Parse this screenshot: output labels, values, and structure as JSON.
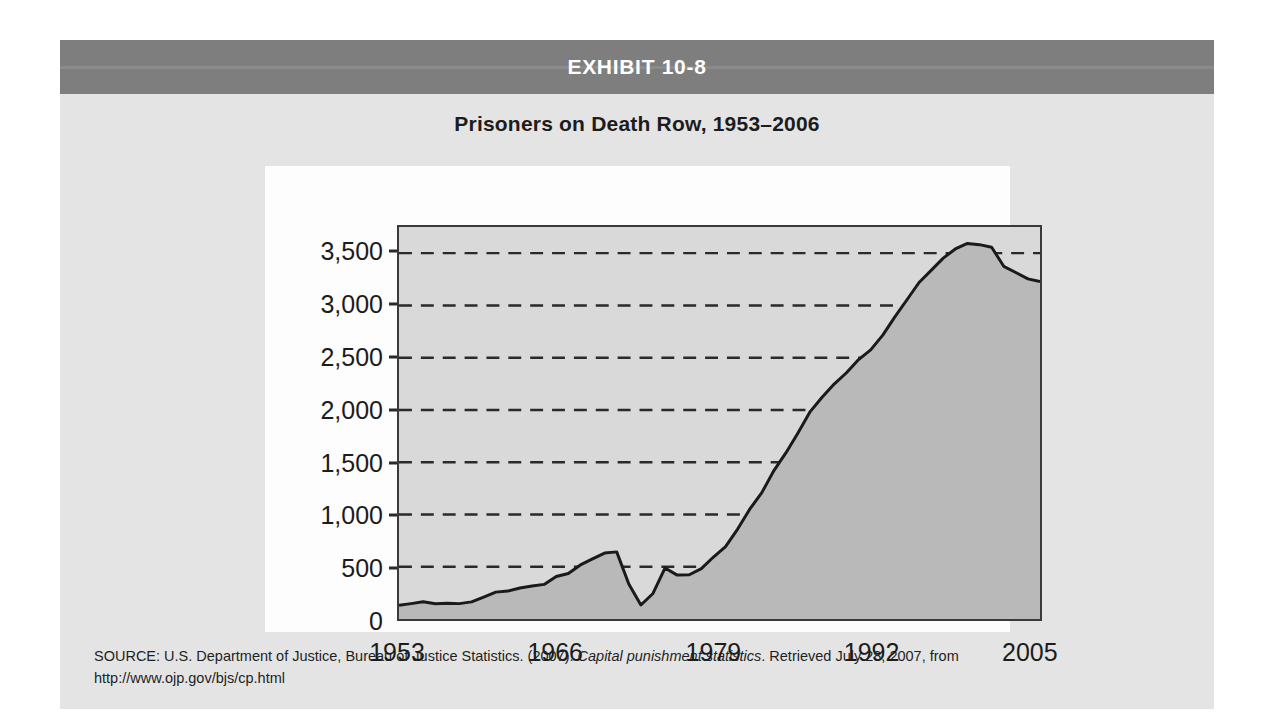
{
  "exhibit": {
    "header_label": "EXHIBIT 10-8",
    "header_bg": "#7e7e7e",
    "panel_bg": "#e4e4e4"
  },
  "source": {
    "prefix": "SOURCE: U.S. Department of Justice, Bureau of Justice Statistics. (2007). ",
    "italic_title": "Capital punishment statistics",
    "suffix": ". Retrieved July 28, 2007, from",
    "url": "http://www.ojp.gov/bjs/cp.html"
  },
  "chart_data": {
    "type": "area",
    "title": "Prisoners on Death Row, 1953–2006",
    "xlabel": "",
    "ylabel": "",
    "xlim": [
      1953,
      2006
    ],
    "ylim": [
      0,
      3750
    ],
    "grid": true,
    "legend": "none",
    "line_color": "#1a1a1a",
    "fill_color": "#b9b9b9",
    "plot_bg": "#d9d9d9",
    "gridline_color": "#2a2a2a",
    "y_ticks": [
      0,
      500,
      1000,
      1500,
      2000,
      2500,
      3000,
      3500
    ],
    "y_tick_labels": [
      "0",
      "500",
      "1,000",
      "1,500",
      "2,000",
      "2,500",
      "3,000",
      "3,500"
    ],
    "x_ticks": [
      1953,
      1966,
      1979,
      1992,
      2005
    ],
    "x_tick_labels": [
      "1953",
      "1966",
      "1979",
      "1992",
      "2005"
    ],
    "x": [
      1953,
      1954,
      1955,
      1956,
      1957,
      1958,
      1959,
      1960,
      1961,
      1962,
      1963,
      1964,
      1965,
      1966,
      1967,
      1968,
      1969,
      1970,
      1971,
      1972,
      1973,
      1974,
      1975,
      1976,
      1977,
      1978,
      1979,
      1980,
      1981,
      1982,
      1983,
      1984,
      1985,
      1986,
      1987,
      1988,
      1989,
      1990,
      1991,
      1992,
      1993,
      1994,
      1995,
      1996,
      1997,
      1998,
      1999,
      2000,
      2001,
      2002,
      2003,
      2004,
      2005,
      2006
    ],
    "values": [
      131,
      147,
      165,
      146,
      151,
      147,
      164,
      210,
      257,
      267,
      297,
      315,
      331,
      406,
      435,
      517,
      575,
      631,
      642,
      334,
      134,
      244,
      488,
      420,
      423,
      482,
      593,
      692,
      860,
      1050,
      1209,
      1420,
      1591,
      1781,
      1984,
      2124,
      2250,
      2356,
      2482,
      2575,
      2716,
      2890,
      3054,
      3219,
      3335,
      3452,
      3540,
      3593,
      3581,
      3557,
      3374,
      3315,
      3254,
      3228
    ],
    "annotations": [
      {
        "label": "peak before Furman v. Georgia",
        "x": 1971,
        "y": 642
      },
      {
        "label": "post-Furman low",
        "x": 1973,
        "y": 134
      },
      {
        "label": "modern peak",
        "x": 2000,
        "y": 3593
      }
    ]
  }
}
